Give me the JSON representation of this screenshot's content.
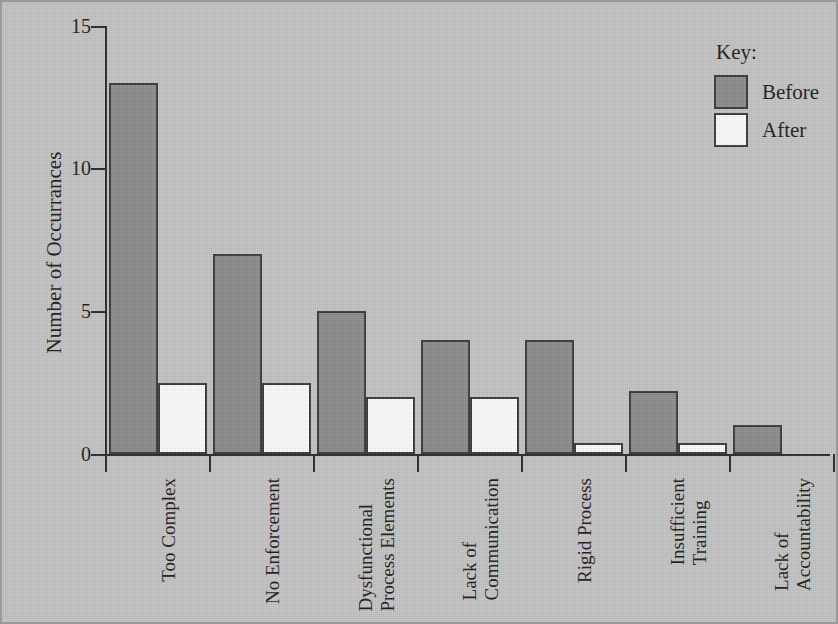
{
  "chart_data": {
    "type": "bar",
    "title": "",
    "xlabel": "",
    "ylabel": "Number of Occurrances",
    "ylim": [
      0,
      15
    ],
    "yticks": [
      0,
      5,
      10,
      15
    ],
    "ytick_labels": [
      "0",
      "5",
      "10",
      "15"
    ],
    "grid": false,
    "legend_position": "top-right",
    "legend_title": "Key:",
    "categories": [
      "Too Complex",
      "Dysfunctional Process Elements",
      "No Enforcement",
      "Lack of Communication",
      "Rigid Process",
      "Insufficient Training",
      "Lack of Accountability"
    ],
    "category_lines": [
      [
        "Too Complex"
      ],
      [
        "No Enforcement"
      ],
      [
        "Dysfunctional",
        "Process Elements"
      ],
      [
        "Lack of",
        "Communication"
      ],
      [
        "Rigid Process"
      ],
      [
        "Insufficient",
        "Training"
      ],
      [
        "Lack of",
        "Accountability"
      ]
    ],
    "series": [
      {
        "name": "Before",
        "color": "#8b8b8b",
        "values": [
          13,
          7,
          5,
          4,
          4,
          2.2,
          1
        ]
      },
      {
        "name": "After",
        "color": "#fbfbfb",
        "values": [
          2.5,
          2.5,
          2,
          2,
          0.4,
          0.4,
          0
        ]
      }
    ]
  },
  "axis": {
    "y_label": "Number of Occurrances",
    "y_ticks": [
      "15",
      "10",
      "5",
      "0"
    ]
  },
  "legend": {
    "title": "Key:",
    "items": [
      {
        "label": "Before",
        "swatch": "before"
      },
      {
        "label": "After",
        "swatch": "after"
      }
    ]
  },
  "xcats": [
    {
      "line1": "Too Complex",
      "line2": ""
    },
    {
      "line1": "No Enforcement",
      "line2": ""
    },
    {
      "line1": "Dysfunctional",
      "line2": "Process Elements"
    },
    {
      "line1": "Lack of",
      "line2": "Communication"
    },
    {
      "line1": "Rigid Process",
      "line2": ""
    },
    {
      "line1": "Insufficient",
      "line2": "Training"
    },
    {
      "line1": "Lack of",
      "line2": "Accountability"
    }
  ]
}
